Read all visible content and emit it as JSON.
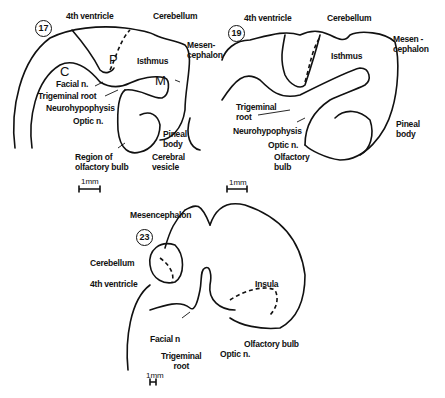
{
  "figures": [
    {
      "stage": "17",
      "labels": {
        "fourth_ventricle": "4th ventricle",
        "cerebellum": "Cerebellum",
        "isthmus": "Isthmus",
        "mesencephalon": "Mesen-\ncephalon",
        "p": "P",
        "c": "C",
        "m": "M",
        "facial_n": "Facial n.",
        "trigeminal_root": "Trigeminal root",
        "neurohypophysis": "Neurohypophysis",
        "optic_n": "Optic n.",
        "pineal_body": "Pineal\nbody",
        "region_olfactory_bulb": "Region of\nolfactory bulb",
        "cerebral_vesicle": "Cerebral\nvesicle"
      },
      "scale_bar": "1mm"
    },
    {
      "stage": "19",
      "labels": {
        "fourth_ventricle": "4th ventricle",
        "cerebellum": "Cerebellum",
        "isthmus": "Isthmus",
        "mesencephalon": "Mesen -\ncephalon",
        "trigeminal_root": "Trigeminal\nroot",
        "neurohypophysis": "Neurohypophysis",
        "optic_n": "Optic n.",
        "olfactory_bulb": "Olfactory\nbulb",
        "pineal_body": "Pineal\nbody"
      },
      "scale_bar": "1mm"
    },
    {
      "stage": "23",
      "labels": {
        "mesencephalon": "Mesencephalon",
        "cerebellum": "Cerebellum",
        "fourth_ventricle": "4th ventricle",
        "insula": "Insula",
        "facial_n": "Facial n",
        "trigeminal_root": "Trigeminal\nroot",
        "optic_n": "Optic n.",
        "olfactory_bulb": "Olfactory bulb"
      },
      "scale_bar": "1mm"
    }
  ]
}
